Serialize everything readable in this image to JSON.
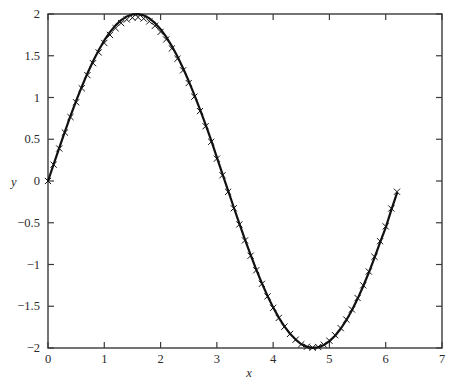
{
  "chart_data": {
    "type": "line",
    "title": "",
    "xlabel": "x",
    "ylabel": "y",
    "xlim": [
      0,
      7
    ],
    "ylim": [
      -2,
      2
    ],
    "grid": false,
    "legend": null,
    "xticks": [
      "0",
      "1",
      "2",
      "3",
      "4",
      "5",
      "6",
      "7"
    ],
    "xtick_values": [
      0,
      1,
      2,
      3,
      4,
      5,
      6,
      7
    ],
    "yticks": [
      "-2",
      "-1.5",
      "-1",
      "-0.5",
      "0",
      "0.5",
      "1",
      "1.5",
      "2"
    ],
    "ytick_values": [
      -2,
      -1.5,
      -1,
      -0.5,
      0,
      0.5,
      1,
      1.5,
      2
    ],
    "series": [
      {
        "name": "exact",
        "style": "solid-line",
        "color": "#111111",
        "formula": "y = 2*sin(x)",
        "x": [
          0,
          0.1,
          0.2,
          0.3,
          0.4,
          0.5,
          0.6,
          0.7,
          0.8,
          0.9,
          1.0,
          1.1,
          1.2,
          1.3,
          1.4,
          1.5,
          1.6,
          1.7,
          1.8,
          1.9,
          2.0,
          2.1,
          2.2,
          2.3,
          2.4,
          2.5,
          2.6,
          2.7,
          2.8,
          2.9,
          3.0,
          3.1,
          3.2,
          3.3,
          3.4,
          3.5,
          3.6,
          3.7,
          3.8,
          3.9,
          4.0,
          4.1,
          4.2,
          4.3,
          4.4,
          4.5,
          4.6,
          4.7,
          4.8,
          4.9,
          5.0,
          5.1,
          5.2,
          5.3,
          5.4,
          5.5,
          5.6,
          5.7,
          5.8,
          5.9,
          6.0,
          6.1,
          6.2
        ],
        "y": [
          0.0,
          0.1997,
          0.3973,
          0.591,
          0.7788,
          0.9589,
          1.1293,
          1.2884,
          1.4347,
          1.5667,
          1.6829,
          1.7824,
          1.864,
          1.9271,
          1.9709,
          1.995,
          1.9992,
          1.9835,
          1.9481,
          1.8935,
          1.8186,
          1.7258,
          1.6161,
          1.4904,
          1.3504,
          1.1969,
          1.032,
          0.8572,
          0.6747,
          0.4864,
          0.2822,
          0.0832,
          -0.1164,
          -0.3146,
          -0.5092,
          -0.7015,
          -0.8859,
          -1.0608,
          -1.2247,
          -1.3761,
          -1.5136,
          -1.6358,
          -1.7414,
          -1.8296,
          -1.8992,
          -1.955,
          -1.986,
          -1.998,
          -1.9908,
          -1.9645,
          -1.9178,
          -1.8526,
          -1.7694,
          -1.667,
          -1.5476,
          -1.4112,
          -1.2606,
          -1.0962,
          -0.9201,
          -0.7347,
          -0.5588,
          -0.3453,
          -0.1456
        ]
      },
      {
        "name": "numerical",
        "style": "x-markers",
        "color": "#111111",
        "marker": "x",
        "x": [
          0.0,
          0.1,
          0.2,
          0.3,
          0.4,
          0.5,
          0.6,
          0.7,
          0.8,
          0.9,
          1.0,
          1.1,
          1.2,
          1.3,
          1.4,
          1.5,
          1.6,
          1.7,
          1.8,
          1.9,
          2.0,
          2.1,
          2.2,
          2.3,
          2.4,
          2.5,
          2.6,
          2.7,
          2.8,
          2.9,
          3.0,
          3.1,
          3.2,
          3.3,
          3.4,
          3.5,
          3.6,
          3.7,
          3.8,
          3.9,
          4.0,
          4.1,
          4.2,
          4.3,
          4.4,
          4.5,
          4.6,
          4.7,
          4.8,
          4.9,
          5.0,
          5.1,
          5.2,
          5.3,
          5.4,
          5.5,
          5.6,
          5.7,
          5.8,
          5.9,
          6.0,
          6.1,
          6.2
        ],
        "y": [
          0.0,
          0.1957,
          0.3893,
          0.58,
          0.7658,
          0.9429,
          1.1103,
          1.2674,
          1.4107,
          1.5397,
          1.6529,
          1.7494,
          1.83,
          1.8911,
          1.9339,
          1.956,
          1.9602,
          1.9455,
          1.9111,
          1.8585,
          1.7856,
          1.6948,
          1.5871,
          1.4634,
          1.3254,
          1.1729,
          1.01,
          0.8372,
          0.6557,
          0.4694,
          0.2672,
          0.0692,
          -0.1294,
          -0.3266,
          -0.5202,
          -0.7115,
          -0.8949,
          -1.0688,
          -1.2317,
          -1.3821,
          -1.5186,
          -1.6398,
          -1.7444,
          -1.8316,
          -1.9002,
          -1.955,
          -1.985,
          -1.996,
          -1.9878,
          -1.9605,
          -1.9128,
          -1.8466,
          -1.7624,
          -1.659,
          -1.5386,
          -1.4012,
          -1.2496,
          -1.0842,
          -0.9071,
          -0.7207,
          -0.5438,
          -0.3293,
          -0.1286
        ]
      }
    ]
  },
  "axis": {
    "x_label": "x",
    "y_label": "y"
  }
}
